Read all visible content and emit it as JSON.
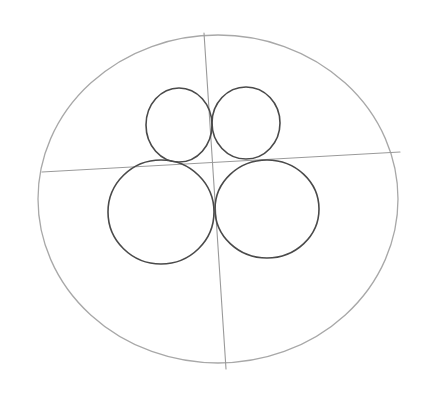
{
  "image": {
    "description": "Pencil sketch on white paper: a large circle with vertical and horizontal construction lines, containing four circles arranged like a paw / clover (two small on top, two larger below).",
    "background": "#ffffff",
    "stroke_colors": {
      "light": "#a8a8a8",
      "guide": "#9a9a9a",
      "dark": "#4a4a4a"
    }
  },
  "shapes": {
    "outer_circle": {
      "cx": 218,
      "cy": 199,
      "rx": 180,
      "ry": 164
    },
    "vertical_guide": {
      "x1": 204,
      "y1": 33,
      "x2": 226,
      "y2": 369
    },
    "horizontal_guide": {
      "x1": 42,
      "y1": 172,
      "x2": 400,
      "y2": 152
    },
    "circles": [
      {
        "name": "top-left",
        "cx": 179,
        "cy": 125,
        "rx": 33,
        "ry": 37
      },
      {
        "name": "top-right",
        "cx": 246,
        "cy": 123,
        "rx": 34,
        "ry": 36
      },
      {
        "name": "bottom-left",
        "cx": 161,
        "cy": 212,
        "rx": 53,
        "ry": 52
      },
      {
        "name": "bottom-right",
        "cx": 267,
        "cy": 209,
        "rx": 52,
        "ry": 49
      }
    ]
  }
}
